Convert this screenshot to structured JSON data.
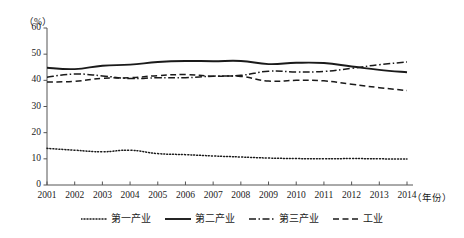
{
  "chart_data": {
    "type": "line",
    "title": "",
    "xlabel": "（年份）",
    "ylabel": "（%）",
    "x": [
      2001,
      2002,
      2003,
      2004,
      2005,
      2006,
      2007,
      2008,
      2009,
      2010,
      2011,
      2012,
      2013,
      2014
    ],
    "xlim": [
      2001,
      2014
    ],
    "ylim": [
      0,
      60
    ],
    "yticks": [
      0,
      10,
      20,
      30,
      40,
      50,
      60
    ],
    "xticks": [
      "2001",
      "2002",
      "2003",
      "2004",
      "2005",
      "2006",
      "2007",
      "2008",
      "2009",
      "2010",
      "2011",
      "2012",
      "2013",
      "2014"
    ],
    "grid": false,
    "legend_position": "bottom",
    "series": [
      {
        "name": "第一产业",
        "style": "dotted",
        "color": "#1a1a1a",
        "values": [
          14.0,
          13.3,
          12.7,
          13.3,
          12.0,
          11.6,
          11.1,
          10.7,
          10.3,
          10.1,
          10.0,
          10.1,
          10.0,
          9.9
        ]
      },
      {
        "name": "第二产业",
        "style": "solid",
        "color": "#1a1a1a",
        "values": [
          44.8,
          44.3,
          45.6,
          46.0,
          47.0,
          47.4,
          47.3,
          47.4,
          46.2,
          46.7,
          46.6,
          45.3,
          44.0,
          43.1
        ]
      },
      {
        "name": "第三产业",
        "style": "dashdot",
        "color": "#1a1a1a",
        "values": [
          41.2,
          42.4,
          41.7,
          40.7,
          41.0,
          41.0,
          41.6,
          41.9,
          43.5,
          43.2,
          43.4,
          44.6,
          46.0,
          47.0
        ]
      },
      {
        "name": "工业",
        "style": "dashed",
        "color": "#1a1a1a",
        "values": [
          39.4,
          39.6,
          40.8,
          41.0,
          41.8,
          42.2,
          41.6,
          41.5,
          39.7,
          40.0,
          39.8,
          38.5,
          37.2,
          36.1
        ]
      }
    ]
  },
  "axis": {
    "y_unit": "（%）",
    "x_unit": "（年份）",
    "y_labels": [
      "60",
      "50",
      "40",
      "30",
      "20",
      "10",
      "0"
    ],
    "x_labels": [
      "2001",
      "2002",
      "2003",
      "2004",
      "2005",
      "2006",
      "2007",
      "2008",
      "2009",
      "2010",
      "2011",
      "2012",
      "2013",
      "2014"
    ]
  },
  "legend": {
    "items": [
      {
        "label": "第一产业",
        "style": "dotted"
      },
      {
        "label": "第二产业",
        "style": "solid"
      },
      {
        "label": "第三产业",
        "style": "dashdot"
      },
      {
        "label": "工业",
        "style": "dashed"
      }
    ]
  },
  "colors": {
    "ink": "#1a1a1a",
    "axis": "#555555",
    "background": "#ffffff"
  }
}
